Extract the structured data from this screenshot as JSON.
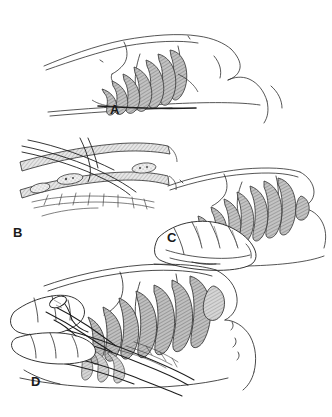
{
  "figure": {
    "background_color": "#ffffff",
    "ink_color": "#2b2b2b",
    "rib_fill_color": "#b9b9b9",
    "rib_hatch_color": "#8a8a8a",
    "label_color": "#1a1a1a",
    "style": "pen-and-ink medical line drawing, four panels"
  },
  "panels": [
    {
      "id": "A",
      "label": "A",
      "label_x": 110,
      "label_y": 103,
      "name": "panel-a-lateral-chest-ribs",
      "description": "Lateral view of patient's thorax with arm raised, ribs shaded",
      "rib_count": 7
    },
    {
      "id": "B",
      "label": "B",
      "label_x": 13,
      "label_y": 226,
      "name": "panel-b-intercostal-detail",
      "description": "Close-up cross-section of intercostal space with neurovascular bundle and instrument",
      "rib_count": 2
    },
    {
      "id": "C",
      "label": "C",
      "label_x": 167,
      "label_y": 231,
      "name": "panel-c-hand-on-chest-wall",
      "description": "Surgeon's hand palpating rib interspace on lateral chest wall",
      "rib_count": 7
    },
    {
      "id": "D",
      "label": "D",
      "label_x": 31,
      "label_y": 375,
      "name": "panel-d-tube-insertion",
      "description": "Gloved hand guiding chest tube with clamp through intercostal space",
      "rib_count": 7
    }
  ]
}
